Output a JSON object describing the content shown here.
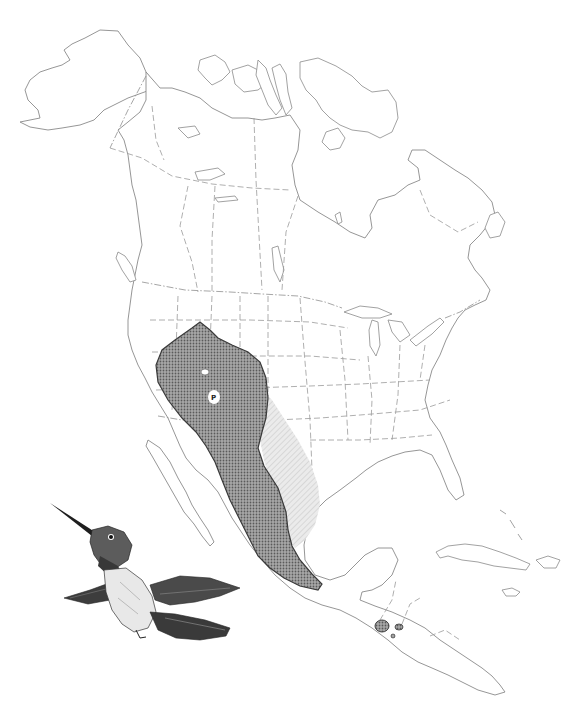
{
  "map": {
    "region": "North America and Central America",
    "background_color": "#ffffff",
    "outline_color": "#8a8a8a",
    "range_layers": [
      {
        "id": "breeding",
        "label": "breeding range",
        "fill": "#8c8c8c",
        "pattern": "dense-dot"
      },
      {
        "id": "migration",
        "label": "migration range",
        "fill": "#d9d9d9",
        "pattern": "light-hatch"
      },
      {
        "id": "winter",
        "label": "winter range (Guatemala)",
        "fill": "#7a7a7a",
        "pattern": "dense-dot"
      }
    ],
    "labels": [
      {
        "text": "P",
        "meaning": "permanent",
        "x": 213,
        "y": 397
      }
    ]
  },
  "illustration": {
    "subject": "hummingbird-in-flight",
    "style": "black-and-white stipple drawing"
  }
}
